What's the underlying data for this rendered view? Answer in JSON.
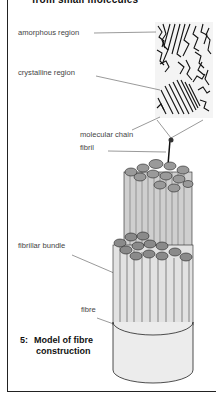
{
  "header": {
    "title_fragment": "from small molecules"
  },
  "labels": {
    "amorphous": "amorphous region",
    "crystalline": "crystalline region",
    "molecular_chain": "molecular chain",
    "fibril": "fibril",
    "fibrillar_bundle": "fibrillar bundle",
    "fibre": "fibre"
  },
  "caption": {
    "number": "5:",
    "line1": "Model of fibre",
    "line2": "construction"
  },
  "colors": {
    "frame": "#222222",
    "label_text": "#444444",
    "caption_text": "#111111",
    "fibre_fill": "#ececec",
    "fibril_fill": "#d0d0d0"
  }
}
